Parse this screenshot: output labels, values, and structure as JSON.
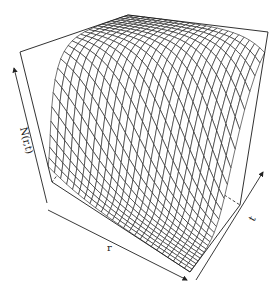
{
  "chart_data": {
    "type": "surface3d",
    "title": "",
    "xlabel": "r",
    "ylabel": "t",
    "zlabel": "N(r,t)",
    "grid_r": 25,
    "grid_t": 25,
    "function": "N = 1 / (1 + exp(-(t*10 - 2 - 6*r)))",
    "x_range": [
      0,
      1
    ],
    "y_range": [
      0,
      1
    ],
    "z_range": [
      0,
      1
    ],
    "box": true,
    "ticks": false,
    "line_color": "#1a1a1a",
    "background": "#ffffff"
  },
  "labels": {
    "z_axis": "N(r,t)",
    "x_axis": "r",
    "y_axis": "t"
  }
}
